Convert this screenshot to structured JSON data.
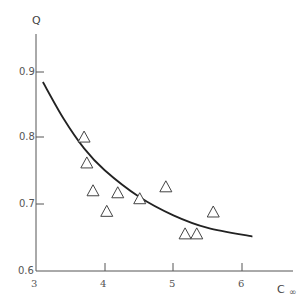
{
  "chart_data": {
    "type": "scatter",
    "title": "",
    "xlabel": "C ∞",
    "ylabel": "Q",
    "xlim": [
      3,
      6.5
    ],
    "ylim": [
      0.6,
      0.95
    ],
    "x_ticks": [
      "3",
      "4",
      "5",
      "6"
    ],
    "y_ticks": [
      "0.6",
      "0.7",
      "0.8",
      "0.9"
    ],
    "grid": false,
    "legend": null,
    "series": [
      {
        "name": "data",
        "marker": "open-triangle",
        "points": [
          {
            "x": 3.7,
            "y": 0.802
          },
          {
            "x": 3.74,
            "y": 0.763
          },
          {
            "x": 3.83,
            "y": 0.721
          },
          {
            "x": 4.03,
            "y": 0.69
          },
          {
            "x": 4.19,
            "y": 0.718
          },
          {
            "x": 4.51,
            "y": 0.709
          },
          {
            "x": 4.89,
            "y": 0.727
          },
          {
            "x": 5.17,
            "y": 0.656
          },
          {
            "x": 5.34,
            "y": 0.656
          },
          {
            "x": 5.58,
            "y": 0.689
          }
        ]
      },
      {
        "name": "fit",
        "type": "line",
        "points": [
          {
            "x": 3.1,
            "y": 0.885
          },
          {
            "x": 3.4,
            "y": 0.83
          },
          {
            "x": 3.7,
            "y": 0.785
          },
          {
            "x": 4.0,
            "y": 0.752
          },
          {
            "x": 4.5,
            "y": 0.712
          },
          {
            "x": 5.0,
            "y": 0.684
          },
          {
            "x": 5.5,
            "y": 0.665
          },
          {
            "x": 6.15,
            "y": 0.652
          }
        ]
      }
    ]
  },
  "axes": {
    "y_label": "Q",
    "x_label_main": "C",
    "x_label_sub": "∞",
    "y_tick_labels": [
      "0.9",
      "0.8",
      "0.7",
      "0.6"
    ],
    "x_tick_labels": [
      "3",
      "4",
      "5",
      "6"
    ]
  }
}
